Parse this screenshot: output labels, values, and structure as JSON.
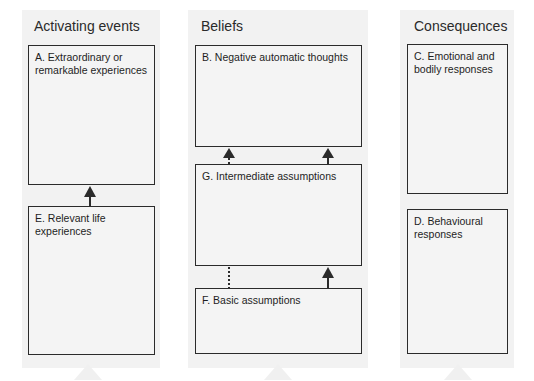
{
  "diagram": {
    "columns": [
      {
        "id": "activating",
        "header": "Activating events"
      },
      {
        "id": "beliefs",
        "header": "Beliefs"
      },
      {
        "id": "consequences",
        "header": "Consequences"
      }
    ],
    "boxes": {
      "A": {
        "label": "A. Extraordinary or remarkable experiences",
        "column": "activating"
      },
      "E": {
        "label": "E. Relevant life experiences",
        "column": "activating"
      },
      "B": {
        "label": "B. Negative automatic thoughts",
        "column": "beliefs"
      },
      "G": {
        "label": "G. Intermediate assumptions",
        "column": "beliefs"
      },
      "F": {
        "label": "F. Basic assumptions",
        "column": "beliefs"
      },
      "C": {
        "label": "C. Emotional and bodily responses",
        "column": "consequences"
      },
      "D": {
        "label": "D. Behavioural responses",
        "column": "consequences"
      }
    },
    "edges": [
      {
        "from": "E",
        "to": "A",
        "style": "solid",
        "arrow": true
      },
      {
        "from": "G",
        "to": "B",
        "style": "dashed",
        "arrow": true,
        "position": "left"
      },
      {
        "from": "G",
        "to": "B",
        "style": "solid",
        "arrow": true,
        "position": "right"
      },
      {
        "from": "F",
        "to": "G",
        "style": "dotted",
        "arrow": false,
        "position": "left"
      },
      {
        "from": "F",
        "to": "G",
        "style": "solid",
        "arrow": true,
        "position": "right"
      }
    ],
    "colors": {
      "line": "#2b2b2b",
      "box_fill": "#f4f4f4",
      "column_fill": "#f2f2f2",
      "background": "#ffffff"
    }
  }
}
